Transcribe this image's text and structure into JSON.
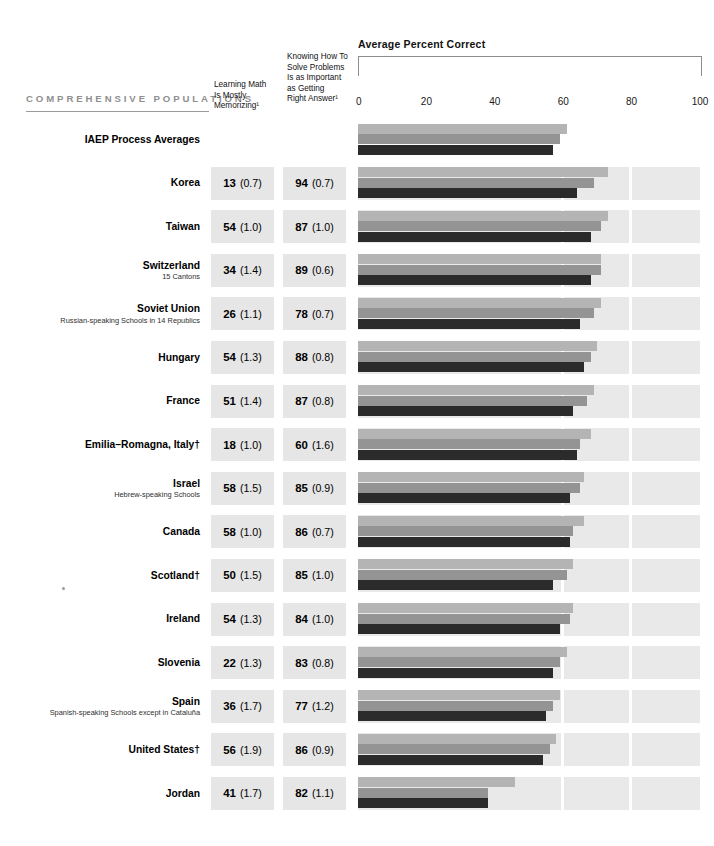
{
  "header": {
    "section_label": "COMPREHENSIVE POPULATIONS",
    "column_1": "Learning Math\nIs Mostly\nMemorizing¹",
    "column_2": "Knowing How To\nSolve Problems\nIs as Important\nas Getting\nRight Answer¹"
  },
  "chart_data": {
    "type": "bar",
    "title": "Average Percent Correct",
    "xlabel": "",
    "ylabel": "",
    "xlim": [
      0,
      100
    ],
    "ticks": [
      0,
      20,
      40,
      60,
      80,
      100
    ],
    "tick_labels": [
      "0",
      "20",
      "40",
      "60",
      "80",
      "100"
    ],
    "grid": false,
    "orientation": "horizontal",
    "legend": [],
    "series": [
      {
        "name": "light-gray-bar",
        "color": "#b4b4b4"
      },
      {
        "name": "medium-gray-bar",
        "color": "#949494"
      },
      {
        "name": "dark-bar",
        "color": "#2b2b2b"
      }
    ],
    "categories": [
      "IAEP Process Averages",
      "Korea",
      "Taiwan",
      "Switzerland",
      "Soviet Union",
      "Hungary",
      "France",
      "Emilia–Romagna, Italy†",
      "Israel",
      "Canada",
      "Scotland†",
      "Ireland",
      "Slovenia",
      "Spain",
      "United States†",
      "Jordan"
    ],
    "rows": [
      {
        "name": "IAEP Process Averages",
        "sub": "",
        "memorizing": "",
        "memorizing_se": "",
        "important": "",
        "important_se": "",
        "bars": [
          61,
          59,
          57
        ],
        "shaded": false
      },
      {
        "name": "Korea",
        "sub": "",
        "memorizing": "13",
        "memorizing_se": "(0.7)",
        "important": "94",
        "important_se": "(0.7)",
        "bars": [
          73,
          69,
          64
        ],
        "shaded": true
      },
      {
        "name": "Taiwan",
        "sub": "",
        "memorizing": "54",
        "memorizing_se": "(1.0)",
        "important": "87",
        "important_se": "(1.0)",
        "bars": [
          73,
          71,
          68
        ],
        "shaded": true
      },
      {
        "name": "Switzerland",
        "sub": "15 Cantons",
        "memorizing": "34",
        "memorizing_se": "(1.4)",
        "important": "89",
        "important_se": "(0.6)",
        "bars": [
          71,
          71,
          68
        ],
        "shaded": true
      },
      {
        "name": "Soviet Union",
        "sub": "Russian-speaking Schools in 14 Republics",
        "memorizing": "26",
        "memorizing_se": "(1.1)",
        "important": "78",
        "important_se": "(0.7)",
        "bars": [
          71,
          69,
          65
        ],
        "shaded": true
      },
      {
        "name": "Hungary",
        "sub": "",
        "memorizing": "54",
        "memorizing_se": "(1.3)",
        "important": "88",
        "important_se": "(0.8)",
        "bars": [
          70,
          68,
          66
        ],
        "shaded": true
      },
      {
        "name": "France",
        "sub": "",
        "memorizing": "51",
        "memorizing_se": "(1.4)",
        "important": "87",
        "important_se": "(0.8)",
        "bars": [
          69,
          67,
          63
        ],
        "shaded": true
      },
      {
        "name": "Emilia–Romagna, Italy†",
        "sub": "",
        "memorizing": "18",
        "memorizing_se": "(1.0)",
        "important": "60",
        "important_se": "(1.6)",
        "bars": [
          68,
          65,
          64
        ],
        "shaded": true
      },
      {
        "name": "Israel",
        "sub": "Hebrew-speaking Schools",
        "memorizing": "58",
        "memorizing_se": "(1.5)",
        "important": "85",
        "important_se": "(0.9)",
        "bars": [
          66,
          65,
          62
        ],
        "shaded": true
      },
      {
        "name": "Canada",
        "sub": "",
        "memorizing": "58",
        "memorizing_se": "(1.0)",
        "important": "86",
        "important_se": "(0.7)",
        "bars": [
          66,
          63,
          62
        ],
        "shaded": true
      },
      {
        "name": "Scotland†",
        "sub": "",
        "memorizing": "50",
        "memorizing_se": "(1.5)",
        "important": "85",
        "important_se": "(1.0)",
        "bars": [
          63,
          61,
          57
        ],
        "shaded": true
      },
      {
        "name": "Ireland",
        "sub": "",
        "memorizing": "54",
        "memorizing_se": "(1.3)",
        "important": "84",
        "important_se": "(1.0)",
        "bars": [
          63,
          62,
          59
        ],
        "shaded": true
      },
      {
        "name": "Slovenia",
        "sub": "",
        "memorizing": "22",
        "memorizing_se": "(1.3)",
        "important": "83",
        "important_se": "(0.8)",
        "bars": [
          61,
          59,
          57
        ],
        "shaded": true
      },
      {
        "name": "Spain",
        "sub": "Spanish-speaking Schools except in Cataluña",
        "memorizing": "36",
        "memorizing_se": "(1.7)",
        "important": "77",
        "important_se": "(1.2)",
        "bars": [
          59,
          57,
          55
        ],
        "shaded": true
      },
      {
        "name": "United States†",
        "sub": "",
        "memorizing": "56",
        "memorizing_se": "(1.9)",
        "important": "86",
        "important_se": "(0.9)",
        "bars": [
          58,
          56,
          54
        ],
        "shaded": true
      },
      {
        "name": "Jordan",
        "sub": "",
        "memorizing": "41",
        "memorizing_se": "(1.7)",
        "important": "82",
        "important_se": "(1.1)",
        "bars": [
          46,
          38,
          38
        ],
        "shaded": true
      }
    ]
  }
}
